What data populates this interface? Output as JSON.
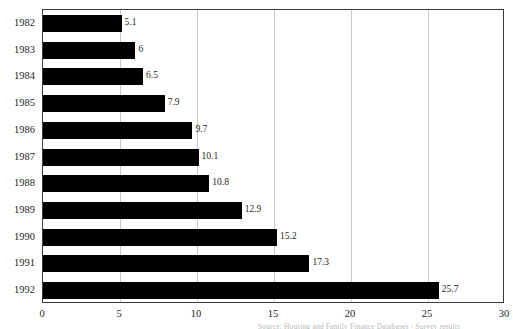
{
  "chart_data": {
    "type": "bar",
    "orientation": "horizontal",
    "title": "",
    "xlabel": "",
    "ylabel": "",
    "xlim": [
      0,
      30
    ],
    "xticks": [
      0,
      5,
      10,
      15,
      20,
      25,
      30
    ],
    "xtick_labels": [
      "0",
      "5",
      "10",
      "15",
      "20",
      "25",
      "30"
    ],
    "grid": "vertical gridlines at each x tick",
    "legend": "none",
    "bar_color": "#000000",
    "grid_color": "#c9c9c9",
    "frame_color": "#3a3a3a",
    "categories": [
      "1982",
      "1983",
      "1984",
      "1985",
      "1986",
      "1987",
      "1988",
      "1989",
      "1990",
      "1991",
      "1992"
    ],
    "values": [
      5.1,
      6,
      6.5,
      7.9,
      9.7,
      10.1,
      10.8,
      12.9,
      15.2,
      17.3,
      25.7
    ],
    "value_labels": [
      "5.1",
      "6",
      "6.5",
      "7.9",
      "9.7",
      "10.1",
      "10.8",
      "12.9",
      "15.2",
      "17.3",
      "25.7"
    ]
  },
  "caption": {
    "source_note": "Source: Housing and Family Finance Databases  -  Survey results"
  }
}
